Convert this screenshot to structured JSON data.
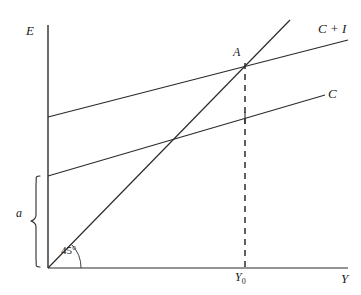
{
  "figure": {
    "type": "keynesian-cross-diagram",
    "background_color": "#ffffff",
    "line_color": "#2b2b2b",
    "width": 361,
    "height": 295
  },
  "axes": {
    "vertical": {
      "label": "E",
      "name": "expenditure-axis",
      "x": 48,
      "y_top": 25,
      "y_bottom": 268
    },
    "horizontal": {
      "label": "Y",
      "name": "income-axis",
      "y": 268,
      "x_left": 48,
      "x_right": 348
    },
    "origin": {
      "x": 48,
      "y": 268
    }
  },
  "lines": [
    {
      "id": "forty-five-degree-line",
      "label": "",
      "x1": 48,
      "y1": 268,
      "x2": 290,
      "y2": 20
    },
    {
      "id": "consumption-plus-investment-line",
      "label": "C + I",
      "x1": 48,
      "y1": 117,
      "x2": 348,
      "y2": 40
    },
    {
      "id": "consumption-line",
      "label": "C",
      "x1": 48,
      "y1": 176,
      "x2": 325,
      "y2": 95
    }
  ],
  "points": [
    {
      "id": "equilibrium-point",
      "label": "A",
      "x": 245,
      "y": 63
    }
  ],
  "dashed_line": {
    "id": "equilibrium-projection",
    "x": 245,
    "y_top": 63,
    "y_bottom": 268,
    "dash_pattern": "6,5"
  },
  "tick_marks": [
    {
      "id": "consumption-tick",
      "x": 245,
      "y": 118,
      "half_height": 6
    }
  ],
  "annotations": {
    "equilibrium_income": {
      "text": "Y",
      "subscript": "0",
      "x": 245,
      "y": 278
    },
    "autonomous_consumption": {
      "label": "a",
      "brace_top": 176,
      "brace_bottom": 267,
      "brace_x": 40
    },
    "angle": {
      "label": "45°",
      "value_degrees": 45,
      "arc_radius": 33
    }
  }
}
